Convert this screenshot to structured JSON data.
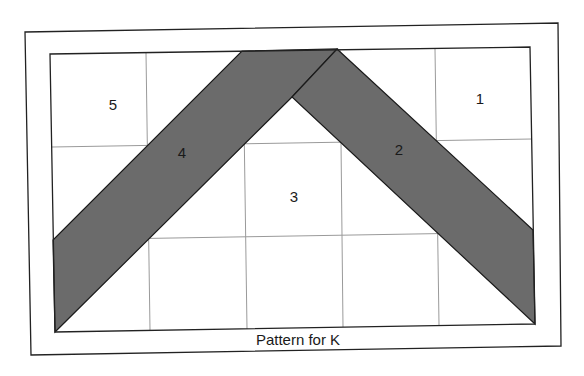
{
  "caption": "Pattern for K",
  "colors": {
    "band_fill": "#6b6b6b",
    "frame_stroke": "#222222",
    "grid_stroke": "#9a9a9a",
    "background": "#ffffff"
  },
  "pieces": [
    {
      "id": "1",
      "label": "1"
    },
    {
      "id": "2",
      "label": "2"
    },
    {
      "id": "3",
      "label": "3"
    },
    {
      "id": "4",
      "label": "4"
    },
    {
      "id": "5",
      "label": "5"
    }
  ],
  "grid": {
    "columns": 5,
    "rows": 3
  }
}
